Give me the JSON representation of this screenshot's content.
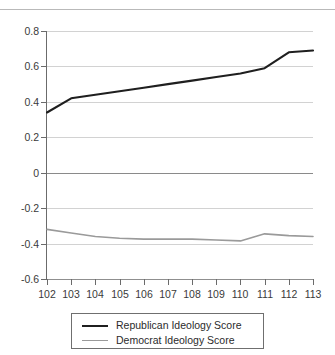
{
  "header": {
    "clipped_title": "",
    "divider": "horizontal-rule"
  },
  "chart_data": {
    "type": "line",
    "title": "",
    "xlabel": "",
    "ylabel": "",
    "x": [
      102,
      103,
      104,
      105,
      106,
      107,
      108,
      109,
      110,
      111,
      112,
      113
    ],
    "categories": [
      "102",
      "103",
      "104",
      "105",
      "106",
      "107",
      "108",
      "109",
      "110",
      "111",
      "112",
      "113"
    ],
    "series": [
      {
        "name": "Republican Ideology Score",
        "color": "#1f1f1f",
        "values": [
          0.34,
          0.42,
          0.44,
          0.46,
          0.48,
          0.5,
          0.52,
          0.54,
          0.56,
          0.59,
          0.68,
          0.69
        ]
      },
      {
        "name": "Democrat Ideology Score",
        "color": "#9a9a9a",
        "values": [
          -0.32,
          -0.34,
          -0.36,
          -0.37,
          -0.375,
          -0.375,
          -0.375,
          -0.38,
          -0.385,
          -0.345,
          -0.355,
          -0.36
        ]
      }
    ],
    "ylim": [
      -0.6,
      0.8
    ],
    "yticks": [
      0.8,
      0.6,
      0.4,
      0.2,
      0,
      -0.2,
      -0.4,
      -0.6
    ],
    "ytick_labels": [
      "0.8",
      "0.6",
      "0.4",
      "0.2",
      "0",
      "-0.2",
      "-0.4",
      "-0.6"
    ],
    "xlim": [
      102,
      113
    ],
    "grid": true,
    "grid_axis": "y",
    "legend_position": "bottom-center",
    "legend_entries": [
      "Republican Ideology Score",
      "Democrat Ideology Score"
    ]
  },
  "legend": {
    "republican_label": "Republican Ideology Score",
    "democrat_label": "Democrat Ideology Score"
  },
  "colors": {
    "republican": "#1f1f1f",
    "democrat": "#9a9a9a",
    "grid": "#d2d2d2",
    "axis": "#6b6b6b",
    "zero_line": "#8a8a8a",
    "text": "#3a3a3a"
  }
}
